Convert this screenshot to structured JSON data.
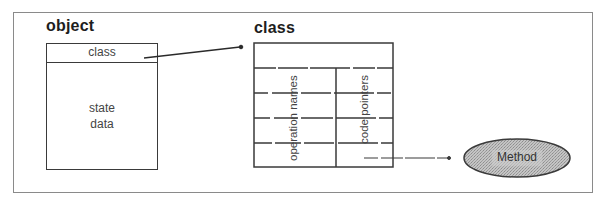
{
  "diagram": {
    "object": {
      "title": "object",
      "class_slot": "class",
      "state_line1": "state",
      "state_line2": "data"
    },
    "class": {
      "title": "class",
      "column_left": "operation names",
      "column_right": "code pointers"
    },
    "method": {
      "label": "Method",
      "fill_color": "#b8b8b8"
    },
    "edges": [
      {
        "from": "object.class",
        "to": "class",
        "style": "solid"
      },
      {
        "from": "class.code pointers",
        "to": "Method",
        "style": "dashed"
      }
    ]
  }
}
